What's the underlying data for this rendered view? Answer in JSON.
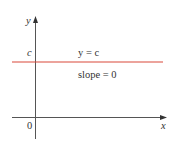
{
  "diagram": {
    "type": "line-graph",
    "axes": {
      "x_label": "x",
      "y_label": "y",
      "origin_label": "0",
      "color": "#555555"
    },
    "line": {
      "equation": "y = c",
      "slope_text": "slope = 0",
      "y_intercept_label": "c",
      "color": "#d9493a"
    }
  }
}
